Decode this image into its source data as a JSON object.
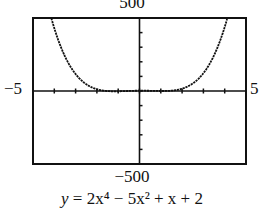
{
  "chart_data": {
    "type": "line",
    "title": "",
    "caption": "y = 2x^4 − 5x^2 + x + 2",
    "function": "2*x^4 - 5*x^2 + x + 2",
    "xlabel": "",
    "ylabel": "",
    "xlim": [
      -5,
      5
    ],
    "ylim": [
      -500,
      500
    ],
    "x_tick_labels": {
      "min": "−5",
      "max": "5"
    },
    "y_tick_labels": {
      "min": "−500",
      "max": "500"
    },
    "xscale_ticks": 1,
    "yscale_ticks": 100,
    "grid": false,
    "series": [
      {
        "name": "y = 2x^4 − 5x^2 + x + 2",
        "x": [
          -4.1,
          -4.0,
          -3.5,
          -3.0,
          -2.5,
          -2.0,
          -1.5,
          -1.0,
          -0.5,
          0,
          0.5,
          1.0,
          1.5,
          2.0,
          2.5,
          3.0,
          3.5,
          4.0,
          4.1
        ],
        "y": [
          480.2,
          430.0,
          233.4,
          116.0,
          45.4,
          12.0,
          -0.5,
          -2.0,
          0.4,
          2.0,
          1.4,
          0,
          3.5,
          16.0,
          49.4,
          122.0,
          240.4,
          438.0,
          489.4
        ]
      }
    ]
  },
  "labels": {
    "y_max": "500",
    "y_min": "−500",
    "x_min": "−5",
    "x_max": "5",
    "equation_prefix": "y",
    "equation_body": " = 2x⁴ − 5x² + x + 2"
  }
}
